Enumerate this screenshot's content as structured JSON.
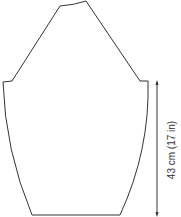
{
  "diagram": {
    "type": "sleeve-schematic",
    "line_color": "#333333",
    "measurements": [
      {
        "id": "sleeve-length",
        "label": "43 cm (17 in)",
        "orientation": "vertical"
      }
    ]
  }
}
